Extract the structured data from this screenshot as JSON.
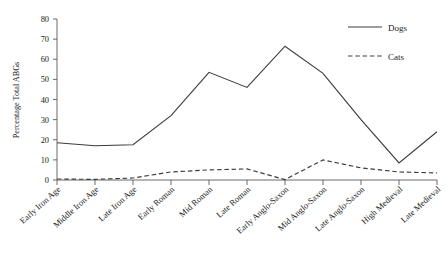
{
  "chart_data": {
    "type": "line",
    "title": "",
    "xlabel": "",
    "ylabel": "Percentage Total ABGs",
    "ylim": [
      0,
      80
    ],
    "yticks": [
      0,
      10,
      20,
      30,
      40,
      50,
      60,
      70,
      80
    ],
    "grid": false,
    "legend_position": "top-right",
    "categories": [
      "Early Iron Age",
      "Middle Iron Age",
      "Late Iron Age",
      "Early Roman",
      "Mid Roman",
      "Late Roman",
      "Early Anglo-Saxon",
      "Mid Anglo-Saxon",
      "Late Anglo-Saxon",
      "High Medieval",
      "Late Medieval"
    ],
    "series": [
      {
        "name": "Dogs",
        "style": "solid",
        "color": "#3c3c3c",
        "values": [
          18.5,
          17.0,
          17.5,
          32.0,
          53.5,
          46.0,
          66.5,
          53.0,
          30.0,
          8.5,
          24.0
        ]
      },
      {
        "name": "Cats",
        "style": "dashed",
        "color": "#3c3c3c",
        "values": [
          0.5,
          0.3,
          1.0,
          4.0,
          5.0,
          5.5,
          0.2,
          10.0,
          6.0,
          4.0,
          3.5
        ]
      }
    ]
  },
  "legend": {
    "items": [
      {
        "label": "Dogs"
      },
      {
        "label": "Cats"
      }
    ]
  }
}
